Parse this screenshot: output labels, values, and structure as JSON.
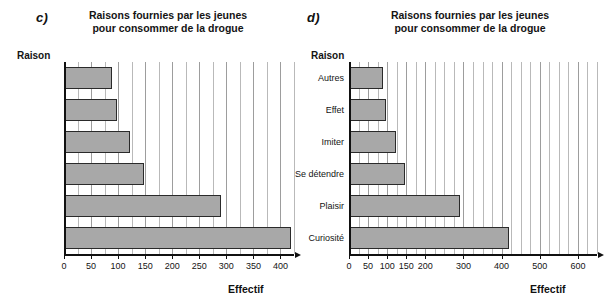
{
  "figure": {
    "panels": [
      {
        "tag": "c)",
        "title": "Raisons fournies par les jeunes\npour consommer de la drogue",
        "y_axis_title": "Raison",
        "x_axis_title": "Effectif"
      },
      {
        "tag": "d)",
        "title": "Raisons fournies par les jeunes\npour consommer de la drogue",
        "y_axis_title": "Raison",
        "x_axis_title": "Effectif"
      }
    ]
  },
  "chart_data": [
    {
      "type": "bar",
      "orientation": "horizontal",
      "panel": "c)",
      "title": "Raisons fournies par les jeunes pour consommer de la drogue",
      "xlabel": "Effectif",
      "ylabel": "Raison",
      "categories": [
        "Autres",
        "Effet",
        "Imiter",
        "Se détendre",
        "Plaisir",
        "Curiosité"
      ],
      "categories_shown": false,
      "values": [
        88,
        98,
        122,
        147,
        290,
        420
      ],
      "xlim": [
        0,
        425
      ],
      "xticks": [
        0,
        50,
        100,
        150,
        200,
        250,
        300,
        350,
        400
      ],
      "xtick_labels": [
        "0",
        "50",
        "100",
        "150",
        "200",
        "250",
        "300",
        "350",
        "400"
      ],
      "minor_grid_step": 25,
      "grid": true,
      "legend": false,
      "bar_fill": "#a8a8a8",
      "bar_edge": "#2a2a2a"
    },
    {
      "type": "bar",
      "orientation": "horizontal",
      "panel": "d)",
      "title": "Raisons fournies par les jeunes pour consommer de la drogue",
      "xlabel": "Effectif",
      "ylabel": "Raison",
      "categories": [
        "Autres",
        "Effet",
        "Imiter",
        "Se détendre",
        "Plaisir",
        "Curiosité"
      ],
      "categories_shown": true,
      "values": [
        88,
        98,
        122,
        147,
        290,
        420
      ],
      "xlim": [
        0,
        650
      ],
      "xticks": [
        0,
        50,
        100,
        150,
        200,
        250,
        300,
        400,
        500,
        600
      ],
      "xtick_labels": [
        "0",
        "50",
        "100",
        "150",
        "200",
        "300",
        "400",
        "500",
        "600"
      ],
      "minor_grid_step": 25,
      "grid": true,
      "legend": false,
      "bar_fill": "#a8a8a8",
      "bar_edge": "#2a2a2a"
    }
  ]
}
